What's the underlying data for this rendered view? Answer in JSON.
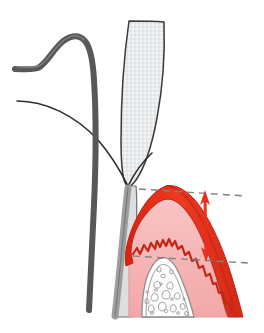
{
  "figure": {
    "name": "periodontal-probing-depth-diagram",
    "background_color": "#ffffff",
    "width": 264,
    "height": 333,
    "caption_text": ""
  },
  "colors": {
    "inflamed_gingiva_red": "#E8301A",
    "inflamed_gingiva_red_dark": "#C9241A",
    "healthy_tissue_pink": "#F4AFAF",
    "tissue_pink_light": "#F9CFCF",
    "bone_outline": "#8D8D8D",
    "tooth_enamel": "#E9EBEC",
    "tooth_outline": "#3A3A3A",
    "probe_gray": "#585858",
    "probe_gray_light": "#7C7C7C",
    "arrow_red": "#E8301A",
    "dashed_line_gray": "#808080",
    "thin_outline": "#2E2E2E"
  },
  "parts": {
    "probe_handle": {
      "name": "periodontal-probe-instrument",
      "stroke_color": "#585858",
      "stroke_width": 6
    },
    "probe_tip": {
      "name": "probe-tip",
      "stroke_color": "#6E6E6E",
      "stroke_width": 5
    },
    "tooth": {
      "name": "tooth-crown-and-root",
      "fill": "#E9EBEC",
      "stroke": "#3A3A3A"
    },
    "gingiva_inflamed": {
      "name": "inflamed-gingiva",
      "fill": "#E8301A",
      "stroke": "#C9241A"
    },
    "gingiva_healthy": {
      "name": "healthy-connective-tissue",
      "fill": "#F4AFAF",
      "stroke": "#E69C9C"
    },
    "alveolar_bone": {
      "name": "alveolar-bone-trabeculae",
      "fill": "#FDFDFD",
      "stroke": "#8D8D8D"
    },
    "gum_contour_line": {
      "name": "gingival-contour-line",
      "stroke": "#2E2E2E",
      "stroke_width": 1.6
    }
  },
  "measurement": {
    "name": "probing-depth-measurement",
    "arrow": {
      "name": "probing-depth-double-arrow",
      "color": "#E8301A",
      "stroke_width": 3,
      "double_headed": true,
      "x": 205,
      "y_top": 192,
      "y_bottom": 260
    },
    "reference_lines": [
      {
        "name": "gingival-margin-dashed-line",
        "color": "#808080",
        "dash": "7 5",
        "x1": 139,
        "y1": 189,
        "x2": 246,
        "y2": 196
      },
      {
        "name": "pocket-base-dashed-line",
        "color": "#808080",
        "dash": "7 5",
        "x1": 133,
        "y1": 256,
        "x2": 248,
        "y2": 263
      }
    ],
    "labels": {
      "top_label": "",
      "bottom_label": "",
      "value_label": ""
    }
  },
  "trabeculae_count": 22
}
